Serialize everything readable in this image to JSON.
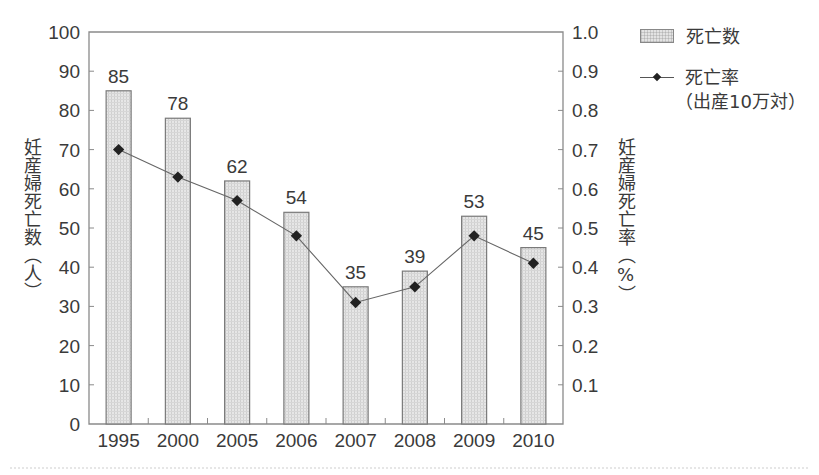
{
  "chart_data": {
    "type": "bar",
    "title": "",
    "categories": [
      "1995",
      "2000",
      "2005",
      "2006",
      "2007",
      "2008",
      "2009",
      "2010"
    ],
    "series": [
      {
        "name": "死亡数",
        "type": "bar",
        "axis": "left",
        "values": [
          85,
          78,
          62,
          54,
          35,
          39,
          53,
          45
        ],
        "data_labels": [
          "85",
          "78",
          "62",
          "54",
          "35",
          "39",
          "53",
          "45"
        ]
      },
      {
        "name": "死亡率（出産10万対）",
        "type": "line",
        "axis": "right",
        "values": [
          0.7,
          0.63,
          0.57,
          0.48,
          0.31,
          0.35,
          0.48,
          0.41
        ]
      }
    ],
    "xlabel": "",
    "ylabel": "妊産婦死亡数（人）",
    "ylabel_right": "妊産婦死亡率（%）",
    "ylim": [
      0,
      100
    ],
    "ylim_right": [
      0,
      1.0
    ],
    "yticks": [
      "0",
      "10",
      "20",
      "30",
      "40",
      "50",
      "60",
      "70",
      "80",
      "90",
      "100"
    ],
    "yticks_right": [
      "0.1",
      "0.2",
      "0.3",
      "0.4",
      "0.5",
      "0.6",
      "0.7",
      "0.8",
      "0.9",
      "1.0"
    ],
    "grid": false,
    "legend_position": "right-top"
  },
  "legend": {
    "bar_label": "死亡数",
    "line_label_1": "死亡率",
    "line_label_2": "（出産10万対）"
  },
  "axis_titles": {
    "left": "妊産婦死亡数（人）",
    "right": "妊産婦死亡率（%）"
  },
  "colors": {
    "bar_fill": "#e3e3e3",
    "bar_stroke": "#7a7a7a",
    "axis": "#8a8a8a",
    "line": "#666666",
    "marker": "#222222"
  }
}
